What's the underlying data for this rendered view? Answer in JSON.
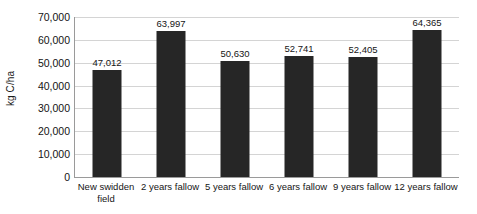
{
  "chart_data": {
    "type": "bar",
    "title": "",
    "xlabel": "",
    "ylabel": "kg C/ha",
    "categories": [
      "New swidden field",
      "2 years fallow",
      "5 years fallow",
      "6 years fallow",
      "9 years fallow",
      "12 years fallow"
    ],
    "values": [
      47012,
      63997,
      50630,
      52741,
      52405,
      64365
    ],
    "value_labels": [
      "47,012",
      "63,997",
      "50,630",
      "52,741",
      "52,405",
      "64,365"
    ],
    "ylim": [
      0,
      70000
    ],
    "yticks": [
      0,
      10000,
      20000,
      30000,
      40000,
      50000,
      60000,
      70000
    ],
    "ytick_labels": [
      "0",
      "10,000",
      "20,000",
      "30,000",
      "40,000",
      "50,000",
      "60,000",
      "70,000"
    ],
    "grid": true,
    "legend": false,
    "bar_color": "#262626",
    "gridline_color": "#d4d4d4",
    "axis_color": "#9a9a9a",
    "background_color": "#ffffff"
  }
}
